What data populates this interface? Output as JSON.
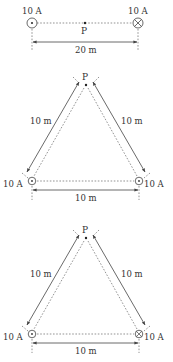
{
  "figures": [
    {
      "id": "fig1",
      "layout": "collinear",
      "left_wire": {
        "current": "10 A",
        "direction": "out-of-page"
      },
      "right_wire": {
        "current": "10 A",
        "direction": "into-page"
      },
      "point_label": "P",
      "separation_label": "20 m"
    },
    {
      "id": "fig2",
      "layout": "equilateral-triangle",
      "apex_label": "P",
      "left_side_label": "10 m",
      "right_side_label": "10 m",
      "base_label": "10 m",
      "left_wire": {
        "current": "10 A",
        "direction": "out-of-page"
      },
      "right_wire": {
        "current": "10 A",
        "direction": "out-of-page"
      }
    },
    {
      "id": "fig3",
      "layout": "equilateral-triangle",
      "apex_label": "P",
      "left_side_label": "10 m",
      "right_side_label": "10 m",
      "base_label": "10 m",
      "left_wire": {
        "current": "10 A",
        "direction": "out-of-page"
      },
      "right_wire": {
        "current": "10 A",
        "direction": "into-page"
      }
    }
  ],
  "colors": {
    "ink": "#333333",
    "background": "#ffffff"
  }
}
